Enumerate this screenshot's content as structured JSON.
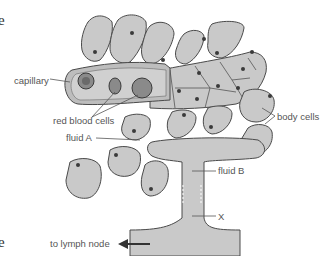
{
  "diagram": {
    "labels": {
      "capillary": "capillary",
      "red_blood_cells": "red blood cells",
      "body_cells": "body cells",
      "fluid_a": "fluid A",
      "fluid_b": "fluid B",
      "x": "X",
      "to_lymph_node": "to lymph node"
    },
    "edge_fragments": {
      "top": "e",
      "middle": "",
      "bottom": "e"
    },
    "colors": {
      "cell_fill": "#c9c9c9",
      "cell_outline": "#4a4a4a",
      "nucleus": "#3a3a3a",
      "capillary_fill": "#bdbdbd",
      "rbc_fill": "#8a8a8a",
      "label_text": "#555555"
    },
    "icons": {
      "arrow": "left-arrow-icon"
    }
  }
}
